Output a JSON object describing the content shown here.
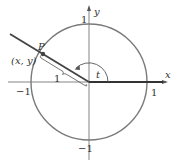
{
  "diagram": {
    "axes": {
      "x_label": "x",
      "y_label": "y"
    },
    "ticks": {
      "x_pos": "1",
      "x_neg": "−1",
      "y_pos": "1",
      "y_neg": "−1"
    },
    "point": {
      "name": "P",
      "coords": "(x, y)"
    },
    "radius_label": "1",
    "angle_label": "t",
    "colors": {
      "circle": "#7a7a7a",
      "axes": "#555555",
      "ray": "#444444",
      "text": "#333333"
    }
  }
}
